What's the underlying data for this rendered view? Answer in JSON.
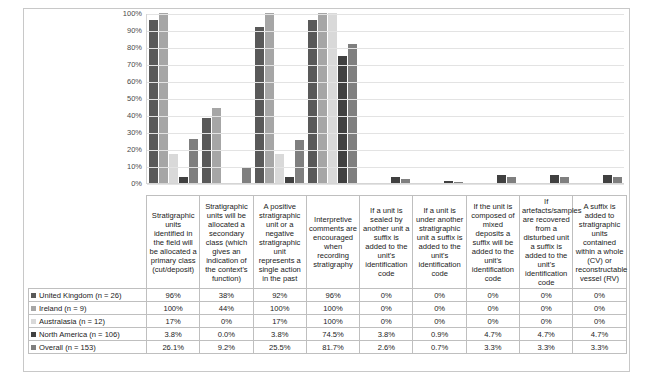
{
  "chart_data": {
    "type": "bar",
    "title": "",
    "xlabel": "",
    "ylabel": "",
    "ylim": [
      0,
      100
    ],
    "yticks": [
      "0%",
      "10%",
      "20%",
      "30%",
      "40%",
      "50%",
      "60%",
      "70%",
      "80%",
      "90%",
      "100%"
    ],
    "grid": true,
    "legend_position": "table-left",
    "categories": [
      "Stratigraphic units identified in the field will be allocated a primary class (cut/deposit)",
      "Stratigraphic units will be allocated a secondary class (which gives an indication of the context's function)",
      "A positive stratigraphic unit or a negative stratigraphic unit represents a single action in the past",
      "Interpretive comments are encouraged when recording stratigraphy",
      "If a unit is sealed by another unit a suffix is added to the unit's identification code",
      "If a unit is under another stratigraphic unit a suffix is added to the unit's identification code",
      "If the unit is composed of mixed deposits a suffix will be added to the unit's identification code",
      "If artefacts/samples are recovered from a disturbed unit a suffix is added to the unit's identification code",
      "A suffix is added to stratigraphic units contained within a whole (CV) or reconstructable vessel (RV)"
    ],
    "series": [
      {
        "name": "United Kingdom (n = 26)",
        "color": "#595959",
        "values": [
          96,
          38,
          92,
          96,
          0,
          0,
          0,
          0,
          0
        ],
        "labels": [
          "96%",
          "38%",
          "92%",
          "96%",
          "0%",
          "0%",
          "0%",
          "0%",
          "0%"
        ]
      },
      {
        "name": "Ireland (n = 9)",
        "color": "#a6a6a6",
        "values": [
          100,
          44,
          100,
          100,
          0,
          0,
          0,
          0,
          0
        ],
        "labels": [
          "100%",
          "44%",
          "100%",
          "100%",
          "0%",
          "0%",
          "0%",
          "0%",
          "0%"
        ]
      },
      {
        "name": "Australasia (n = 12)",
        "color": "#d9d9d9",
        "values": [
          17,
          0,
          17,
          100,
          0,
          0,
          0,
          0,
          0
        ],
        "labels": [
          "17%",
          "0%",
          "17%",
          "100%",
          "0%",
          "0%",
          "0%",
          "0%",
          "0%"
        ]
      },
      {
        "name": "North America (n = 106)",
        "color": "#404040",
        "values": [
          3.8,
          0.0,
          3.8,
          74.5,
          3.8,
          0.9,
          4.7,
          4.7,
          4.7
        ],
        "labels": [
          "3.8%",
          "0.0%",
          "3.8%",
          "74.5%",
          "3.8%",
          "0.9%",
          "4.7%",
          "4.7%",
          "4.7%"
        ]
      },
      {
        "name": "Overall (n = 153)",
        "color": "#7f7f7f",
        "values": [
          26.1,
          9.2,
          25.5,
          81.7,
          2.6,
          0.7,
          3.3,
          3.3,
          3.3
        ],
        "labels": [
          "26.1%",
          "9.2%",
          "25.5%",
          "81.7%",
          "2.6%",
          "0.7%",
          "3.3%",
          "3.3%",
          "3.3%"
        ]
      }
    ]
  }
}
